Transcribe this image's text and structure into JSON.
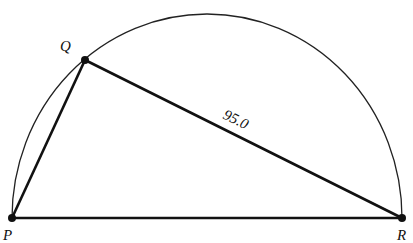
{
  "diagram": {
    "type": "geometry",
    "points": [
      {
        "id": "P",
        "label": "P",
        "x": 12,
        "y": 218
      },
      {
        "id": "Q",
        "label": "Q",
        "x": 85,
        "y": 60
      },
      {
        "id": "R",
        "label": "R",
        "x": 402,
        "y": 218
      }
    ],
    "segments": [
      {
        "from": "P",
        "to": "Q",
        "label": ""
      },
      {
        "from": "Q",
        "to": "R",
        "label": "95.0"
      },
      {
        "from": "P",
        "to": "R",
        "label": ""
      }
    ],
    "arc": {
      "type": "semicircle",
      "diameter": [
        "P",
        "R"
      ]
    },
    "labels": {
      "P": "P",
      "Q": "Q",
      "R": "R",
      "QR_length": "95.0"
    }
  }
}
